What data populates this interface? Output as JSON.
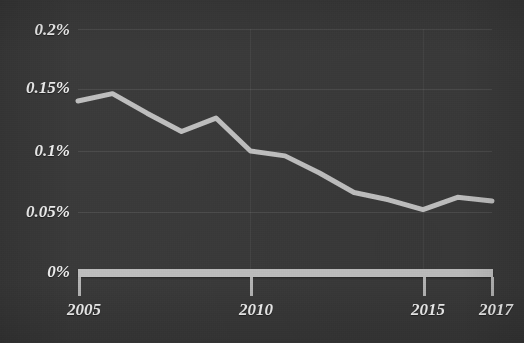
{
  "chart_data": {
    "type": "line",
    "title": "",
    "subtitle": "",
    "xlabel": "",
    "ylabel": "",
    "x": [
      2005,
      2006,
      2007,
      2008,
      2009,
      2010,
      2011,
      2012,
      2013,
      2014,
      2015,
      2016,
      2017
    ],
    "series": [
      {
        "name": "share",
        "values": [
          0.141,
          0.147,
          0.131,
          0.116,
          0.127,
          0.1,
          0.096,
          0.082,
          0.066,
          0.06,
          0.052,
          0.062,
          0.059
        ],
        "color": "#bdbdbd"
      }
    ],
    "xlim": [
      2005,
      2017
    ],
    "ylim": [
      0,
      0.2
    ],
    "y_ticks": [
      0,
      0.05,
      0.1,
      0.15,
      0.2
    ],
    "y_tick_labels": [
      "0%",
      "0.05%",
      "0.1%",
      "0.15%",
      "0.2%"
    ],
    "x_ticks": [
      2005,
      2010,
      2015,
      2017
    ],
    "x_tick_labels": [
      "2005",
      "2010",
      "2015",
      "2017"
    ],
    "grid": true,
    "grid_axis": "y",
    "legend": false,
    "legend_position": "none",
    "units": "percent",
    "background_color": "#3a3a3a",
    "text_color": "#f1f1f1",
    "axis_color": "#bcbcbc"
  },
  "axes": {
    "y_tick_labels": [
      "0.2%",
      "0.15%",
      "0.1%",
      "0.05%",
      "0%"
    ],
    "x_tick_labels": [
      "2005",
      "2010",
      "2015",
      "2017"
    ]
  },
  "title": {
    "text": ""
  }
}
